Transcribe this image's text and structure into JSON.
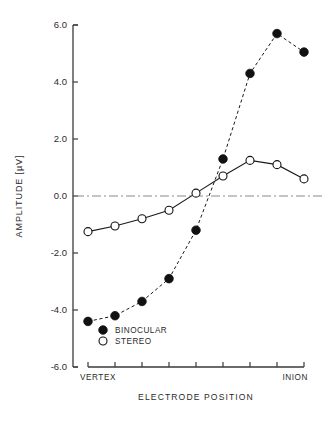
{
  "chart_data": {
    "type": "line",
    "title": "",
    "xlabel": "ELECTRODE POSITION",
    "ylabel": "AMPLITUDE [µV]",
    "ylim": [
      -6.0,
      6.0
    ],
    "yticks": [
      "6.0",
      "4.0",
      "2.0",
      "0.0",
      "-2.0",
      "-4.0",
      "-6.0"
    ],
    "ytick_values": [
      6.0,
      4.0,
      2.0,
      0.0,
      -2.0,
      -4.0,
      -6.0
    ],
    "grid": false,
    "zero_reference_line": true,
    "legend_position": "lower-left-inside",
    "x_axis_type": "categorical-electrode-positions",
    "x_positions": [
      1,
      2,
      3,
      4,
      5,
      6,
      7,
      8,
      9
    ],
    "x_end_labels": {
      "left": "VERTEX",
      "right": "INION"
    },
    "xtick_count": 9,
    "series": [
      {
        "name": "BINOCULAR",
        "marker": "filled-circle",
        "line": "dashed",
        "color": "#111111",
        "values": [
          -4.4,
          -4.2,
          -3.7,
          -2.9,
          -1.2,
          1.3,
          4.3,
          5.7,
          5.05
        ]
      },
      {
        "name": "STEREO",
        "marker": "open-circle",
        "line": "solid",
        "color": "#111111",
        "values": [
          -1.25,
          -1.05,
          -0.8,
          -0.5,
          0.1,
          0.7,
          1.25,
          1.1,
          0.6
        ]
      }
    ]
  },
  "legend": {
    "items": [
      {
        "label": "BINOCULAR",
        "marker": "filled-circle"
      },
      {
        "label": "STEREO",
        "marker": "open-circle"
      }
    ]
  },
  "axes": {
    "y_label": "AMPLITUDE [µV]",
    "x_label": "ELECTRODE POSITION",
    "y_ticks": [
      "6.0",
      "4.0",
      "2.0",
      "0.0",
      "-2.0",
      "-4.0",
      "-6.0"
    ],
    "x_left_end": "VERTEX",
    "x_right_end": "INION"
  },
  "colors": {
    "axis": "#3a3a3a",
    "data": "#111111",
    "zero_line": "#8a8a8a",
    "background": "#ffffff"
  }
}
